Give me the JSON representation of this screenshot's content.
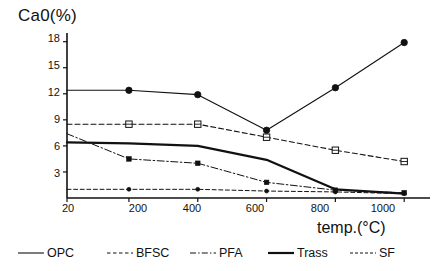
{
  "chart_data": {
    "type": "line",
    "title": "",
    "ylabel": "Ca0(%)",
    "xlabel": "temp.(°C)",
    "x": [
      20,
      200,
      400,
      600,
      800,
      1000
    ],
    "xticklabels": [
      "20",
      "200",
      "400",
      "600",
      "800",
      "1000"
    ],
    "yticklabels": [
      "3",
      "6",
      "9",
      "12",
      "15",
      "18"
    ],
    "yticks": [
      3,
      6,
      9,
      12,
      15,
      18
    ],
    "xlim": [
      20,
      1075
    ],
    "ylim": [
      0,
      19
    ],
    "grid": false,
    "legend_position": "bottom",
    "series": [
      {
        "name": "OPC",
        "values": [
          12.4,
          12.4,
          11.9,
          7.8,
          12.7,
          17.9
        ],
        "style": "solid-thin",
        "marker": "filled-circle"
      },
      {
        "name": "BFSC",
        "values": [
          8.5,
          8.5,
          8.5,
          7.0,
          5.5,
          4.2
        ],
        "style": "dashed",
        "marker": "open-square"
      },
      {
        "name": "PFA",
        "values": [
          7.4,
          4.5,
          4.0,
          1.8,
          0.9,
          0.6
        ],
        "style": "dash-dot",
        "marker": "filled-square-small"
      },
      {
        "name": "Trass",
        "values": [
          6.4,
          6.3,
          6.0,
          4.4,
          1.0,
          0.5
        ],
        "style": "solid-thick",
        "marker": "none"
      },
      {
        "name": "SF",
        "values": [
          1.0,
          1.0,
          1.0,
          0.8,
          0.7,
          0.5
        ],
        "style": "dashed-thin",
        "marker": "filled-circle-small"
      }
    ]
  },
  "legend": {
    "items": [
      {
        "label": "OPC",
        "style": "solid-thin"
      },
      {
        "label": "BFSC",
        "style": "dashed"
      },
      {
        "label": "PFA",
        "style": "dash-dot"
      },
      {
        "label": "Trass",
        "style": "solid-thick"
      },
      {
        "label": "SF",
        "style": "dashed-thin"
      }
    ]
  },
  "colors": {
    "ink": "#111111",
    "background": "#ffffff"
  }
}
